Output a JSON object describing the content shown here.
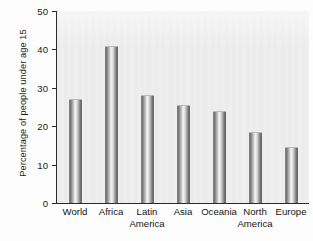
{
  "chart_data": {
    "type": "bar",
    "title": "",
    "xlabel": "",
    "ylabel": "Percentage of people under age 15",
    "categories": [
      "World",
      "Africa",
      "Latin America",
      "Asia",
      "Oceania",
      "North America",
      "Europe"
    ],
    "category_lines": [
      [
        "World",
        ""
      ],
      [
        "Africa",
        ""
      ],
      [
        "Latin",
        "America"
      ],
      [
        "Asia",
        ""
      ],
      [
        "Oceania",
        ""
      ],
      [
        "North",
        "America"
      ],
      [
        "Europe",
        ""
      ]
    ],
    "values": [
      27,
      41,
      28,
      25.5,
      24,
      18.5,
      14.5
    ],
    "ylim": [
      0,
      50
    ],
    "yticks": [
      0,
      10,
      20,
      30,
      40,
      50
    ],
    "ytick_labels": [
      "0",
      "10",
      "20",
      "30",
      "40",
      "50"
    ],
    "grid": false,
    "legend": null,
    "bar_color": "#9a9a9a",
    "plot_background": "#eeeeee"
  }
}
